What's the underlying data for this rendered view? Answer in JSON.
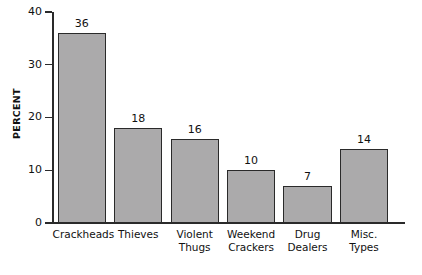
{
  "chart_data": {
    "type": "bar",
    "title": "",
    "xlabel": "",
    "ylabel": "PERCENT",
    "categories": [
      "Crackheads",
      "Violent Thugs",
      "Weekend Crackers",
      "Drug Dealers",
      "Misc. Types",
      "Thieves"
    ],
    "category_lines": [
      {
        "line1": "Crackheads",
        "line2": ""
      },
      {
        "line1": "Thieves",
        "line2": ""
      },
      {
        "line1": "Violent",
        "line2": "Thugs"
      },
      {
        "line1": "Weekend",
        "line2": "Crackers"
      },
      {
        "line1": "Drug",
        "line2": "Dealers"
      },
      {
        "line1": "Misc.",
        "line2": "Types"
      }
    ],
    "values": [
      36,
      18,
      16,
      10,
      7,
      14
    ],
    "value_labels": [
      "36",
      "18",
      "16",
      "10",
      "7",
      "14"
    ],
    "ylim": [
      0,
      40
    ],
    "ytick_values": [
      0,
      10,
      20,
      30,
      40
    ],
    "ytick_labels": [
      "0",
      "10",
      "20",
      "30",
      "40"
    ],
    "grid": false,
    "legend": false,
    "bar_fill_color": "#abaaab",
    "bar_edge_color": "#2a2a2a",
    "axis_color": "#2a2a2a",
    "background_color": "#ffffff"
  }
}
